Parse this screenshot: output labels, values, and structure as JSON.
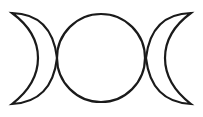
{
  "symbol": {
    "name": "triple moon",
    "stroke_color": "#1a1a1a",
    "background": "#ffffff",
    "parts": [
      "waxing crescent",
      "full moon",
      "waning crescent"
    ]
  }
}
